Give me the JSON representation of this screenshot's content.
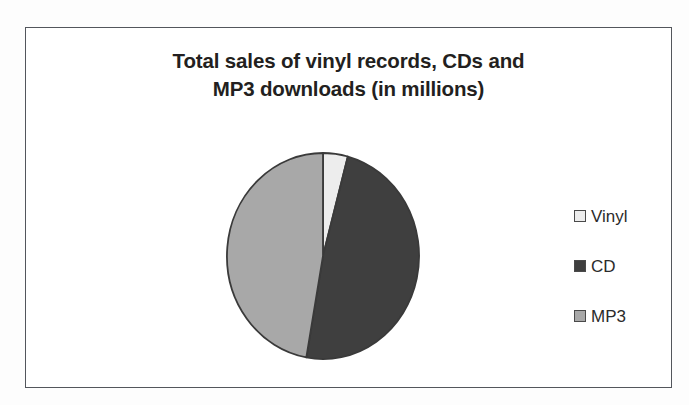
{
  "chart_title_lines": [
    "Total sales of vinyl records, CDs and",
    "MP3 downloads (in millions)"
  ],
  "legend": {
    "items": [
      {
        "label": "Vinyl",
        "color": "#ededed"
      },
      {
        "label": "CD",
        "color": "#3f3f3f"
      },
      {
        "label": "MP3",
        "color": "#a8a8a8"
      }
    ]
  },
  "chart_data": {
    "type": "pie",
    "title": "Total sales of vinyl records, CDs and MP3 downloads (in millions)",
    "categories": [
      "Vinyl",
      "CD",
      "MP3"
    ],
    "values": [
      4,
      48,
      48
    ],
    "units": "millions",
    "start_angle_deg": 0,
    "direction": "clockwise",
    "slice_angles_deg": [
      15,
      175,
      170
    ],
    "colors": [
      "#ededed",
      "#3f3f3f",
      "#a8a8a8"
    ],
    "slice_border_color": "#3a3a3a",
    "legend_position": "right",
    "data_labels": false,
    "grid": false,
    "xlabel": "",
    "ylabel": ""
  }
}
